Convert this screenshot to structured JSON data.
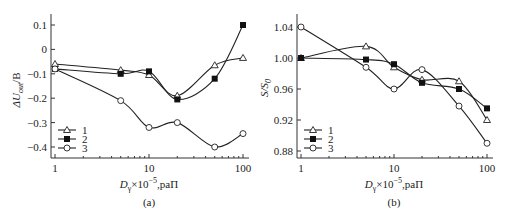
{
  "chart_data": [
    {
      "type": "line",
      "panel_label": "(a)",
      "xlabel": "D_γ×10⁻⁵, paП",
      "ylabel": "ΔU_out/B",
      "xscale": "log",
      "xlim": [
        1,
        100
      ],
      "ylim": [
        -0.45,
        0.15
      ],
      "x_ticks": [
        "1",
        "10",
        "100"
      ],
      "y_ticks": [
        "0.1",
        "0",
        "−0.1",
        "−0.2",
        "−0.3",
        "−0.4"
      ],
      "grid": false,
      "legend_position": "lower left",
      "x": [
        1,
        5,
        10,
        20,
        50,
        100
      ],
      "series": [
        {
          "name": "1",
          "marker": "open-triangle",
          "values": [
            -0.06,
            -0.085,
            -0.105,
            -0.19,
            -0.065,
            -0.035
          ]
        },
        {
          "name": "2",
          "marker": "filled-square",
          "values": [
            -0.08,
            -0.1,
            -0.09,
            -0.205,
            -0.12,
            0.1
          ]
        },
        {
          "name": "3",
          "marker": "open-circle",
          "values": [
            -0.08,
            -0.21,
            -0.32,
            -0.3,
            -0.4,
            -0.345
          ]
        }
      ]
    },
    {
      "type": "line",
      "panel_label": "(b)",
      "xlabel": "D_γ×10⁻⁵, paП",
      "ylabel": "S/S₀",
      "xscale": "log",
      "xlim": [
        1,
        100
      ],
      "ylim": [
        0.87,
        1.06
      ],
      "x_ticks": [
        "1",
        "10",
        "100"
      ],
      "y_ticks": [
        "1.04",
        "1.00",
        "0.96",
        "0.92",
        "0.88"
      ],
      "grid": false,
      "legend_position": "lower left",
      "x": [
        1,
        5,
        10,
        20,
        50,
        100
      ],
      "series": [
        {
          "name": "1",
          "marker": "open-triangle",
          "values": [
            1.0,
            1.015,
            0.988,
            0.972,
            0.97,
            0.92
          ]
        },
        {
          "name": "2",
          "marker": "filled-square",
          "values": [
            1.0,
            0.998,
            0.992,
            0.968,
            0.96,
            0.935
          ]
        },
        {
          "name": "3",
          "marker": "open-circle",
          "values": [
            1.04,
            0.988,
            0.96,
            0.985,
            0.938,
            0.89
          ]
        }
      ]
    }
  ],
  "panels": [
    {
      "label": "(a)",
      "xlabel_main": "D",
      "xlabel_sub": "γ",
      "xlabel_rest": "×10",
      "xlabel_exp": "−5",
      "xlabel_unit": ",paП",
      "ylabel_main": "ΔU",
      "ylabel_sub": "out",
      "ylabel_rest": "/B"
    },
    {
      "label": "(b)",
      "xlabel_main": "D",
      "xlabel_sub": "γ",
      "xlabel_rest": "×10",
      "xlabel_exp": "−5",
      "xlabel_unit": ",paП",
      "ylabel_main": "S/S",
      "ylabel_sub": "0",
      "ylabel_rest": ""
    }
  ],
  "legend": [
    "1",
    "2",
    "3"
  ]
}
